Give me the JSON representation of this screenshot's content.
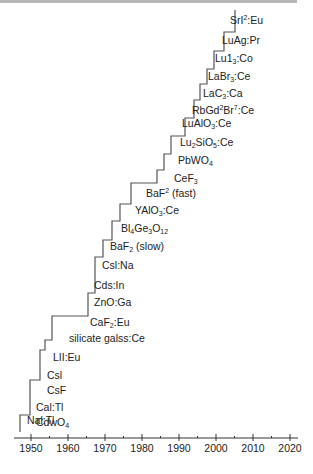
{
  "chart_data": {
    "type": "line",
    "subtype": "step",
    "title": "",
    "xlabel": "",
    "ylabel": "",
    "xlim": [
      1945,
      2022
    ],
    "x_ticks": [
      1950,
      1960,
      1970,
      1980,
      1990,
      2000,
      2010,
      2020
    ],
    "grid": false,
    "legend": null,
    "series": [
      {
        "name": "Scintillator discovery",
        "points": [
          {
            "year": 1948,
            "label": "NaI:Tl"
          },
          {
            "year": 1950,
            "label": "CaI:Tl"
          },
          {
            "year": 1950,
            "label": "CdWO4"
          },
          {
            "year": 1952,
            "label": "CsF"
          },
          {
            "year": 1952,
            "label": "CsI"
          },
          {
            "year": 1954,
            "label": "LiI:Eu"
          },
          {
            "year": 1955,
            "label": "silicate glass:Ce"
          },
          {
            "year": 1964,
            "label": "CaF2:Eu"
          },
          {
            "year": 1966,
            "label": "ZnO:Ga"
          },
          {
            "year": 1966,
            "label": "CdS:In"
          },
          {
            "year": 1968,
            "label": "CsI:Na"
          },
          {
            "year": 1971,
            "label": "BaF2 (slow)"
          },
          {
            "year": 1973,
            "label": "Bi4Ge3O12"
          },
          {
            "year": 1976,
            "label": "YAlO3:Ce"
          },
          {
            "year": 1979,
            "label": "BaF2 (fast)"
          },
          {
            "year": 1987,
            "label": "CeF3"
          },
          {
            "year": 1989,
            "label": "PbWO4"
          },
          {
            "year": 1991,
            "label": "Lu2SiO5:Ce"
          },
          {
            "year": 1995,
            "label": "LuAlO3:Ce"
          },
          {
            "year": 1998,
            "label": "RbGd2Br7:Ce"
          },
          {
            "year": 2000,
            "label": "LaCl3:Ce"
          },
          {
            "year": 2001,
            "label": "LaBr3:Ce"
          },
          {
            "year": 2002,
            "label": "LuI3:Ce"
          },
          {
            "year": 2005,
            "label": "LuAG:Pr"
          },
          {
            "year": 2008,
            "label": "SrI2:Eu"
          }
        ]
      }
    ]
  },
  "labels": [
    {
      "html": "SrI<sup>2</sup>:Eu",
      "x": 230,
      "y": 20
    },
    {
      "html": "LuAg:Pr",
      "x": 222,
      "y": 40
    },
    {
      "html": "Lu1<sub>3</sub>:Co",
      "x": 215,
      "y": 58
    },
    {
      "html": "LaBr<sub>3</sub>:Ce",
      "x": 208,
      "y": 76
    },
    {
      "html": "LaC<sub>3</sub>:Ca",
      "x": 203,
      "y": 93
    },
    {
      "html": "RbGd<sup>2</sup>Br<sup>7</sup>:Ce",
      "x": 192,
      "y": 110
    },
    {
      "html": "LuAlO<sub>3</sub>:Ce",
      "x": 182,
      "y": 123
    },
    {
      "html": "Lu<sub>2</sub>SiO<sub>5</sub>:Ce",
      "x": 180,
      "y": 142
    },
    {
      "html": "PbWO<sub>4</sub>",
      "x": 178,
      "y": 160
    },
    {
      "html": "CeF<sub>3</sub>",
      "x": 174,
      "y": 178
    },
    {
      "html": "BaF<sup>2</sup> (fast)",
      "x": 146,
      "y": 193
    },
    {
      "html": "YAlO<sub>3</sub>:Ce",
      "x": 135,
      "y": 210
    },
    {
      "html": "Bl<sub>4</sub>Ge<sub>3</sub>O<sub>12</sub>",
      "x": 121,
      "y": 228
    },
    {
      "html": "BaF<sub>2</sub> (slow)",
      "x": 110,
      "y": 246
    },
    {
      "html": "Csl:Na",
      "x": 102,
      "y": 265
    },
    {
      "html": "Cds:In",
      "x": 94,
      "y": 285
    },
    {
      "html": "ZnO:Ga",
      "x": 94,
      "y": 302
    },
    {
      "html": "CaF<sub>2</sub>:Eu",
      "x": 90,
      "y": 322
    },
    {
      "html": "silicate galss:Ce",
      "x": 69,
      "y": 338
    },
    {
      "html": "LII:Eu",
      "x": 53,
      "y": 357
    },
    {
      "html": "Csl",
      "x": 47,
      "y": 375
    },
    {
      "html": "CsF",
      "x": 47,
      "y": 390
    },
    {
      "html": "Cal:Tl",
      "x": 36,
      "y": 407
    },
    {
      "html": "CdwO<sub>4</sub>",
      "x": 36,
      "y": 422
    },
    {
      "html": "Nal:Tl",
      "x": 27,
      "y": 420
    }
  ],
  "step_path": "M20,432 L20,415 L30,415 L30,380 L40,380 L40,350 L45,350 L45,340 L52,340 L52,316 L88,316 L88,293 L95,293 L95,257 L103,257 L103,240 L112,240 L112,221 L120,221 L120,204 L131,204 L131,183 L157,183 L157,170 L164,170 L164,154 L171,154 L171,136 L185,136 L185,118 L194,118 L194,100 L200,100 L200,84 L207,84 L207,69 L214,69 L214,51 L224,51 L224,32 L235,32 L235,10",
  "axis": {
    "x1": 14,
    "x2": 298,
    "y": 438,
    "x_origin_year": 1950,
    "x_origin_px": 31,
    "px_per_year": 3.7
  }
}
